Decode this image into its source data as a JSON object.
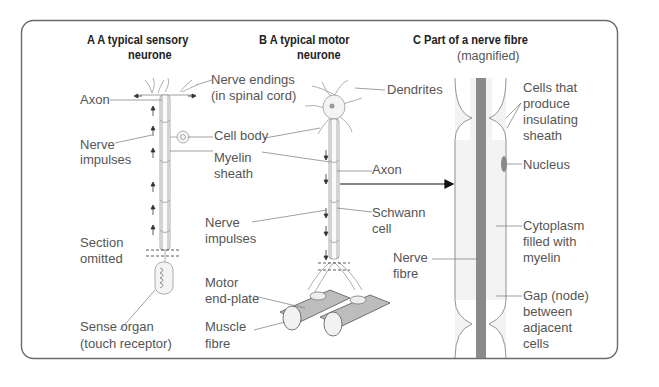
{
  "panels": {
    "a": {
      "title_line1": "A  A typical sensory",
      "title_line2": "neurone",
      "labels": {
        "axon": "Axon",
        "nerve_endings_1": "Nerve endings",
        "nerve_endings_2": "(in spinal cord)",
        "nerve_impulses_1": "Nerve",
        "nerve_impulses_2": "impulses",
        "cell_body": "Cell body",
        "myelin_1": "Myelin",
        "myelin_2": "sheath",
        "section_1": "Section",
        "section_2": "omitted",
        "sense_1": "Sense organ",
        "sense_2": "(touch receptor)"
      }
    },
    "b": {
      "title_line1": "B  A typical motor",
      "title_line2": "neurone",
      "labels": {
        "dendrites": "Dendrites",
        "axon": "Axon",
        "nerve_impulses_1": "Nerve",
        "nerve_impulses_2": "impulses",
        "schwann_1": "Schwann",
        "schwann_2": "cell",
        "motor_1": "Motor",
        "motor_2": "end-plate",
        "muscle_1": "Muscle",
        "muscle_2": "fibre"
      }
    },
    "c": {
      "title": "C   Part of a nerve fibre",
      "subtitle": "(magnified)",
      "labels": {
        "cells_1": "Cells that",
        "cells_2": "produce",
        "cells_3": "insulating",
        "cells_4": "sheath",
        "nucleus": "Nucleus",
        "nerve_fibre_1": "Nerve",
        "nerve_fibre_2": "fibre",
        "cytoplasm_1": "Cytoplasm",
        "cytoplasm_2": "filled with",
        "cytoplasm_3": "myelin",
        "gap_1": "Gap (node)",
        "gap_2": "between",
        "gap_3": "adjacent",
        "gap_4": "cells"
      }
    }
  },
  "colors": {
    "frame": "#6b6b6b",
    "nerve_fibre": "#8a8a8a",
    "myelin_fill": "#f2f2f2",
    "text": "#555555",
    "heading": "#222222"
  }
}
